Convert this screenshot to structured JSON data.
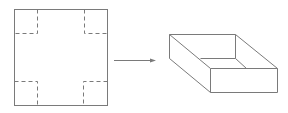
{
  "diagram": {
    "colors": {
      "line": "#7a7a7a",
      "background": "#ffffff"
    },
    "sheet": {
      "x": 14,
      "y": 9,
      "width": 93,
      "height": 96,
      "cut_inset_x": 23,
      "cut_inset_y": 24
    },
    "arrow": {
      "x1": 114,
      "y1": 60,
      "x2": 155,
      "y2": 60
    },
    "box": {
      "back_top_left": [
        169,
        34
      ],
      "back_top_right": [
        235,
        34
      ],
      "front_top_left": [
        210,
        68
      ],
      "front_top_right": [
        277,
        68
      ],
      "front_bottom_left": [
        210,
        92
      ],
      "front_bottom_right": [
        277,
        92
      ],
      "left_bottom_back": [
        169,
        58
      ],
      "inner_back_left": [
        200,
        58
      ],
      "inner_back_right": [
        235,
        58
      ],
      "inner_front_right": [
        246,
        68
      ]
    }
  }
}
